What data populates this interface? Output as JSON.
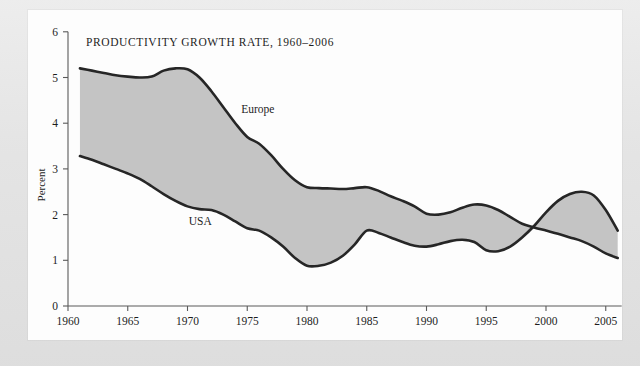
{
  "chart_data": {
    "type": "area",
    "title": "PRODUCTIVITY GROWTH RATE, 1960–2006",
    "xlabel": "",
    "ylabel": "Percent",
    "xlim": [
      1960,
      2006
    ],
    "ylim": [
      0,
      6
    ],
    "grid": false,
    "legend_position": "inline-annotations",
    "x_ticks": [
      "1960",
      "1965",
      "1970",
      "1975",
      "1980",
      "1985",
      "1990",
      "1995",
      "2000",
      "2005"
    ],
    "x_tick_values": [
      1960,
      1965,
      1970,
      1975,
      1980,
      1985,
      1990,
      1995,
      2000,
      2005
    ],
    "y_ticks": [
      "0",
      "1",
      "2",
      "3",
      "4",
      "5",
      "6"
    ],
    "y_tick_values": [
      0,
      1,
      2,
      3,
      4,
      5,
      6
    ],
    "fill_between": true,
    "fill_color": "#c4c4c4",
    "line_color": "#262626",
    "x": [
      1961,
      1962,
      1963,
      1964,
      1965,
      1966,
      1967,
      1968,
      1969,
      1970,
      1971,
      1972,
      1973,
      1974,
      1975,
      1976,
      1977,
      1978,
      1979,
      1980,
      1981,
      1982,
      1983,
      1984,
      1985,
      1986,
      1987,
      1988,
      1989,
      1990,
      1991,
      1992,
      1993,
      1994,
      1995,
      1996,
      1997,
      1998,
      1999,
      2000,
      2001,
      2002,
      2003,
      2004,
      2005,
      2006
    ],
    "series": [
      {
        "name": "Europe",
        "label": "Europe",
        "values": [
          5.2,
          5.15,
          5.1,
          5.05,
          5.02,
          5.0,
          5.02,
          5.15,
          5.2,
          5.18,
          5.0,
          4.7,
          4.35,
          4.0,
          3.7,
          3.55,
          3.3,
          3.0,
          2.75,
          2.6,
          2.58,
          2.57,
          2.56,
          2.58,
          2.6,
          2.52,
          2.4,
          2.3,
          2.18,
          2.02,
          2.0,
          2.05,
          2.15,
          2.22,
          2.2,
          2.1,
          1.95,
          1.8,
          1.72,
          1.65,
          1.58,
          1.5,
          1.42,
          1.3,
          1.15,
          1.05
        ]
      },
      {
        "name": "USA",
        "label": "USA",
        "values": [
          3.28,
          3.2,
          3.1,
          3.0,
          2.9,
          2.78,
          2.62,
          2.45,
          2.3,
          2.18,
          2.12,
          2.1,
          2.0,
          1.85,
          1.7,
          1.65,
          1.5,
          1.3,
          1.05,
          0.88,
          0.88,
          0.95,
          1.1,
          1.35,
          1.65,
          1.6,
          1.5,
          1.4,
          1.32,
          1.3,
          1.35,
          1.42,
          1.45,
          1.4,
          1.22,
          1.2,
          1.3,
          1.5,
          1.75,
          2.05,
          2.3,
          2.45,
          2.5,
          2.42,
          2.1,
          1.65
        ]
      }
    ],
    "annotations": [
      {
        "text": "Europe",
        "x": 1974.5,
        "y": 4.22
      },
      {
        "text": "USA",
        "x": 1970.1,
        "y": 1.78
      }
    ]
  }
}
